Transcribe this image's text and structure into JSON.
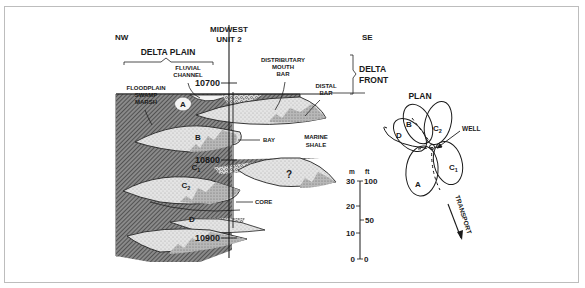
{
  "cross_section": {
    "direction_left": "NW",
    "direction_right": "SE",
    "well_name_line1": "MIDWEST",
    "well_name_line2": "UNIT 2",
    "delta_plain_label": "DELTA PLAIN",
    "delta_front_line1": "DELTA",
    "delta_front_line2": "FRONT",
    "fluvial_line1": "FLUVIAL",
    "fluvial_line2": "CHANNEL",
    "floodplain_line1": "FLOODPLAIN",
    "floodplain_line2": "SWAMP",
    "floodplain_line3": "MARSH",
    "distributary_line1": "DISTRIBUTARY",
    "distributary_line2": "MOUTH",
    "distributary_line3": "BAR",
    "distal_line1": "DISTAL",
    "distal_line2": "BAR",
    "bay_label": "BAY",
    "marine_line1": "MARINE",
    "marine_line2": "SHALE",
    "core_label": "CORE",
    "depths": [
      "10700",
      "10800",
      "10900"
    ],
    "units": {
      "A": "A",
      "B": "B",
      "C1": "C",
      "C1_sub": "1",
      "C2": "C",
      "C2_sub": "2",
      "D": "D",
      "unknown": "?"
    }
  },
  "scale": {
    "unit_m": "m",
    "unit_ft": "ft",
    "m_ticks": [
      "30",
      "20",
      "10",
      "0"
    ],
    "ft_ticks": [
      "100",
      "50",
      "0"
    ]
  },
  "plan": {
    "title": "PLAN",
    "well_label": "WELL",
    "transport_label": "TRANSPORT",
    "lobes": {
      "A": "A",
      "B": "B",
      "C1": "C",
      "C1_sub": "1",
      "C2": "C",
      "C2_sub": "2",
      "D": "D"
    }
  }
}
